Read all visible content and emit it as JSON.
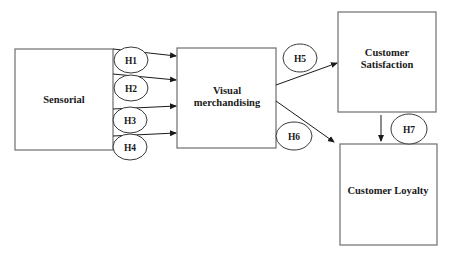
{
  "diagram": {
    "nodes": {
      "sensorial": {
        "label": "Sensorial"
      },
      "visual": {
        "line1": "Visual",
        "line2": "merchandising"
      },
      "satisfaction": {
        "line1": "Customer",
        "line2": "Satisfaction"
      },
      "loyalty": {
        "label": "Customer Loyalty"
      }
    },
    "hypotheses": {
      "h1": "H1",
      "h2": "H2",
      "h3": "H3",
      "h4": "H4",
      "h5": "H5",
      "h6": "H6",
      "h7": "H7"
    },
    "edges": [
      {
        "from": "sensorial",
        "to": "visual",
        "label": "H1"
      },
      {
        "from": "sensorial",
        "to": "visual",
        "label": "H2"
      },
      {
        "from": "sensorial",
        "to": "visual",
        "label": "H3"
      },
      {
        "from": "sensorial",
        "to": "visual",
        "label": "H4"
      },
      {
        "from": "visual",
        "to": "satisfaction",
        "label": "H5"
      },
      {
        "from": "visual",
        "to": "loyalty",
        "label": "H6"
      },
      {
        "from": "satisfaction",
        "to": "loyalty",
        "label": "H7"
      }
    ]
  }
}
